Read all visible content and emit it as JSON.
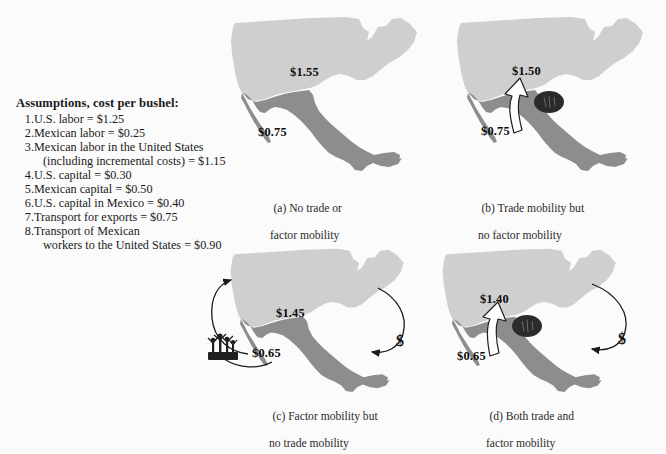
{
  "figure": {
    "background_color": "#fbfbfb",
    "us_fill_color": "#cfcfcf",
    "mexico_fill_color": "#8d8d8d",
    "arrow_fill_color": "#ffffff",
    "arrow_stroke_color": "#1a1a1a",
    "corn_icon_color": "#2b2b2b",
    "workers_icon_color": "#1f1f1f"
  },
  "assumptions": {
    "heading": "Assumptions, cost per bushel:",
    "items": [
      {
        "num": "1.",
        "text": "U.S. labor = $1.25",
        "cont": ""
      },
      {
        "num": "2.",
        "text": "Mexican labor = $0.25",
        "cont": ""
      },
      {
        "num": "3.",
        "text": "Mexican labor in the United States",
        "cont": "(including incremental costs) = $1.15"
      },
      {
        "num": "4.",
        "text": "U.S. capital = $0.30",
        "cont": ""
      },
      {
        "num": "5.",
        "text": "Mexican capital = $0.50",
        "cont": ""
      },
      {
        "num": "6.",
        "text": "U.S. capital in Mexico = $0.40",
        "cont": ""
      },
      {
        "num": "7.",
        "text": "Transport for exports = $0.75",
        "cont": ""
      },
      {
        "num": "8.",
        "text": "Transport of Mexican",
        "cont": "workers to the United States = $0.90"
      }
    ]
  },
  "panels": {
    "a": {
      "label": "(a) No trade or",
      "label_line2": "factor mobility",
      "us_price": "$1.55",
      "mexico_price": "$0.75",
      "icons": []
    },
    "b": {
      "label": "(b) Trade mobility but",
      "label_line2": "no factor mobility",
      "us_price": "$1.50",
      "mexico_price": "$0.75",
      "icons": [
        "corn-icon",
        "trade-arrow-up-icon"
      ]
    },
    "c": {
      "label": "(c) Factor mobility but",
      "label_line2": "no trade mobility",
      "us_price": "$1.45",
      "mexico_price": "$0.65",
      "dollar_symbol": "$",
      "icons": [
        "workers-icon",
        "worker-migration-arrow-icon",
        "capital-flow-arrow-icon"
      ]
    },
    "d": {
      "label": "(d) Both trade and",
      "label_line2": "factor mobility",
      "us_price": "$1.40",
      "mexico_price": "$0.65",
      "dollar_symbol": "$",
      "icons": [
        "corn-icon",
        "trade-arrow-up-icon",
        "capital-flow-arrow-icon"
      ]
    }
  }
}
